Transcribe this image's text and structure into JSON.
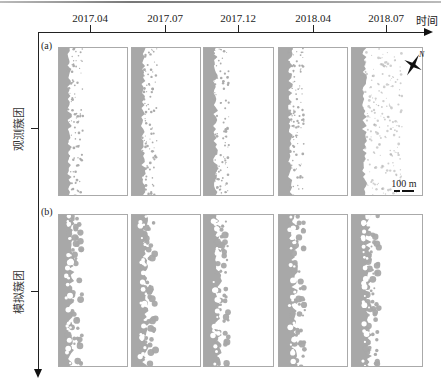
{
  "figure": {
    "time_axis": {
      "label": "时间",
      "ticks": [
        "2017.04",
        "2017.07",
        "2017.12",
        "2018.04",
        "2018.07"
      ]
    },
    "rows": [
      {
        "tag": "(a)",
        "label": "观测簇团"
      },
      {
        "tag": "(b)",
        "label": "模拟簇团"
      }
    ],
    "scale_bar": "100 m",
    "compass": "N",
    "colors": {
      "vegetation": "#a8a8a8",
      "panel_border": "#aaaaaa",
      "axis": "#222222"
    }
  }
}
